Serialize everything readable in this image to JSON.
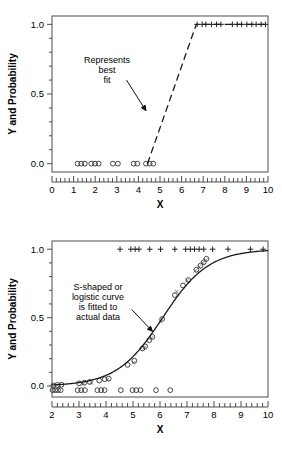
{
  "figure": {
    "name": "logistic-regression-two-panel-figure",
    "background": "#ffffff",
    "ink_color": "#1a1a1a"
  },
  "chart_data": [
    {
      "type": "scatter",
      "panel": "top",
      "title": "",
      "xlabel": "X",
      "ylabel": "Y and Probability",
      "xlim": [
        0,
        10
      ],
      "ylim": [
        -0.06,
        1.06
      ],
      "xticks": [
        0,
        1,
        2,
        3,
        4,
        5,
        6,
        7,
        8,
        9,
        10
      ],
      "xtick_labels": [
        "0",
        "1",
        "2",
        "3",
        "4",
        "5",
        "6",
        "7",
        "8",
        "9",
        "10"
      ],
      "yticks": [
        0.0,
        0.5,
        1.0
      ],
      "ytick_labels": [
        "0.0",
        "0.5",
        "1.0"
      ],
      "minor_ticks": true,
      "grid": false,
      "legend": "none",
      "annotations": [
        {
          "text": "Represents\nbest\nfit",
          "lines": [
            "Represents",
            "best",
            "fit"
          ],
          "x": 2.55,
          "y": 0.72,
          "arrow_from_x": 3.45,
          "arrow_from_y": 0.6,
          "arrow_to_x": 4.35,
          "arrow_to_y": 0.38
        }
      ],
      "series": [
        {
          "name": "observed-zero-outcomes",
          "marker": "o",
          "y_value": 0.0,
          "x": [
            1.18,
            1.35,
            1.52,
            1.82,
            1.99,
            2.16,
            2.82,
            3.05,
            3.78,
            3.95,
            4.35,
            4.52,
            4.69
          ]
        },
        {
          "name": "observed-one-outcomes",
          "marker": "+",
          "y_value": 1.0,
          "x": [
            6.72,
            6.95,
            7.12,
            7.38,
            7.62,
            7.82,
            8.35,
            8.58,
            8.78,
            9.02,
            9.25,
            9.45,
            9.68,
            9.88
          ]
        },
        {
          "name": "step-best-fit-line",
          "marker": "none",
          "style": "dashed",
          "points": [
            [
              4.42,
              0.0
            ],
            [
              6.68,
              1.0
            ],
            [
              10.0,
              1.0
            ]
          ]
        }
      ]
    },
    {
      "type": "scatter",
      "panel": "bottom",
      "title": "",
      "xlabel": "X",
      "ylabel": "Y and Probability",
      "xlim": [
        2,
        10
      ],
      "ylim": [
        -0.08,
        1.06
      ],
      "xticks": [
        2,
        3,
        4,
        5,
        6,
        7,
        8,
        9,
        10
      ],
      "xtick_labels": [
        "2",
        "3",
        "4",
        "5",
        "6",
        "7",
        "8",
        "9",
        "10"
      ],
      "yticks": [
        0.0,
        0.5,
        1.0
      ],
      "ytick_labels": [
        "0.0",
        "0.5",
        "1.0"
      ],
      "minor_ticks": true,
      "grid": false,
      "legend": "none",
      "annotations": [
        {
          "text": "S-shaped or\nlogistic curve\nis fitted to\nactual data",
          "lines": [
            "S-shaped or",
            "logistic curve",
            "is fitted to",
            "actual data"
          ],
          "x": 3.7,
          "y": 0.7,
          "arrow_from_x": 4.95,
          "arrow_from_y": 0.56,
          "arrow_to_x": 5.72,
          "arrow_to_y": 0.4
        }
      ],
      "series": [
        {
          "name": "observed-one-outcomes",
          "marker": "+",
          "y_value": 1.0,
          "x": [
            4.52,
            4.92,
            5.08,
            5.22,
            5.62,
            6.02,
            6.55,
            6.95,
            7.12,
            7.28,
            7.45,
            7.62,
            7.95,
            8.52,
            9.35,
            9.82
          ]
        },
        {
          "name": "observed-zero-outcomes",
          "marker": "o",
          "y_value": -0.03,
          "x": [
            2.02,
            2.12,
            2.22,
            2.32,
            2.95,
            3.08,
            3.22,
            3.68,
            3.82,
            3.95,
            4.55,
            4.98,
            5.12,
            5.28,
            5.85,
            6.38
          ]
        },
        {
          "name": "binned-proportions",
          "marker": "o",
          "points": [
            [
              2.05,
              0.005
            ],
            [
              2.2,
              0.008
            ],
            [
              2.35,
              0.01
            ],
            [
              3.0,
              0.02
            ],
            [
              3.2,
              0.025
            ],
            [
              3.4,
              0.03
            ],
            [
              3.75,
              0.04
            ],
            [
              3.95,
              0.05
            ],
            [
              4.1,
              0.055
            ],
            [
              4.8,
              0.155
            ],
            [
              5.05,
              0.185
            ],
            [
              5.35,
              0.275
            ],
            [
              5.45,
              0.29
            ],
            [
              5.6,
              0.335
            ],
            [
              5.72,
              0.36
            ],
            [
              6.08,
              0.49
            ],
            [
              6.55,
              0.665
            ],
            [
              6.85,
              0.735
            ],
            [
              7.05,
              0.775
            ],
            [
              7.35,
              0.85
            ],
            [
              7.5,
              0.88
            ],
            [
              7.62,
              0.905
            ],
            [
              7.72,
              0.93
            ]
          ]
        },
        {
          "name": "residual-x-marks",
          "marker": "x",
          "points": [
            [
              2.08,
              -0.01
            ],
            [
              2.25,
              -0.005
            ],
            [
              3.15,
              0.015
            ],
            [
              3.45,
              0.025
            ],
            [
              4.05,
              0.045
            ],
            [
              5.02,
              0.17
            ],
            [
              5.42,
              0.28
            ],
            [
              5.68,
              0.35
            ],
            [
              6.02,
              0.47
            ],
            [
              6.62,
              0.69
            ],
            [
              7.0,
              0.77
            ],
            [
              7.3,
              0.84
            ],
            [
              7.45,
              0.87
            ],
            [
              7.58,
              0.9
            ],
            [
              7.68,
              0.92
            ]
          ]
        },
        {
          "name": "fitted-logistic-curve",
          "marker": "none",
          "style": "solid",
          "equation": "p = 1 / (1 + exp(-(x - 6.1) / 0.85))",
          "midpoint_x": 6.1,
          "scale": 0.85
        }
      ]
    }
  ]
}
